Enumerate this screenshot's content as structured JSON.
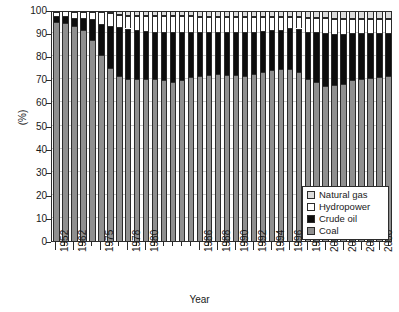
{
  "chart_data": {
    "type": "bar",
    "title": "",
    "subtitle": "",
    "xlabel": "Year",
    "ylabel": "(%)",
    "ylim": [
      0,
      100
    ],
    "ytick_labels": [
      "0",
      "10",
      "20",
      "30",
      "40",
      "50",
      "60",
      "70",
      "80",
      "90",
      "100"
    ],
    "ytick_values": [
      0,
      10,
      20,
      30,
      40,
      50,
      60,
      70,
      80,
      90,
      100
    ],
    "grid": true,
    "stacked": true,
    "legend_position": "inside-bottom-right",
    "legend_entries": [
      "Natural gas",
      "Hydropower",
      "Crude oil",
      "Coal"
    ],
    "categories": [
      "1952",
      "1957",
      "1962",
      "1965",
      "1970",
      "1975",
      "1976",
      "1977",
      "1978",
      "1979",
      "1980",
      "1981",
      "1982",
      "1983",
      "1984",
      "1985",
      "1986",
      "1987",
      "1988",
      "1989",
      "1990",
      "1991",
      "1992",
      "1993",
      "1994",
      "1995",
      "1996",
      "1997",
      "1998",
      "1999",
      "2000",
      "2001",
      "2002",
      "2003",
      "2004",
      "2005",
      "2006",
      "2007"
    ],
    "xtick_labels": [
      "1952",
      "1962",
      "1975",
      "1978",
      "1980",
      "1986",
      "1988",
      "1990",
      "1992",
      "1994",
      "1996",
      "1998",
      "2000",
      "2002",
      "2004",
      "2006"
    ],
    "series": [
      {
        "name": "Coal",
        "color": "#8f8f8f",
        "values": [
          95.0,
          94.5,
          93.0,
          91.5,
          87.0,
          80.5,
          75.0,
          71.5,
          70.0,
          70.0,
          70.0,
          70.0,
          69.5,
          69.0,
          69.5,
          71.0,
          71.5,
          72.0,
          72.5,
          72.0,
          72.0,
          71.5,
          72.5,
          73.0,
          74.0,
          74.5,
          74.5,
          73.0,
          70.0,
          69.0,
          67.0,
          67.5,
          68.0,
          69.5,
          70.0,
          70.5,
          71.0,
          71.5
        ]
      },
      {
        "name": "Crude oil",
        "color": "#0d0d0d",
        "values": [
          2.5,
          3.0,
          3.5,
          5.0,
          9.0,
          13.5,
          18.0,
          21.0,
          22.0,
          21.5,
          21.0,
          20.5,
          21.0,
          21.5,
          21.0,
          19.5,
          19.0,
          18.5,
          18.0,
          18.5,
          18.5,
          19.0,
          18.0,
          18.0,
          17.5,
          17.0,
          17.5,
          19.0,
          20.5,
          21.5,
          23.0,
          22.0,
          21.5,
          20.5,
          20.0,
          19.5,
          19.0,
          18.5
        ]
      },
      {
        "name": "Hydropower",
        "color": "#ffffff",
        "values": [
          1.8,
          2.0,
          2.5,
          2.5,
          3.0,
          5.0,
          5.5,
          5.5,
          5.5,
          6.0,
          6.5,
          7.0,
          7.0,
          7.0,
          7.0,
          7.0,
          6.5,
          6.5,
          6.5,
          6.5,
          6.5,
          6.5,
          6.5,
          6.0,
          5.5,
          5.5,
          5.0,
          5.0,
          6.0,
          6.0,
          6.5,
          6.5,
          6.5,
          6.0,
          6.0,
          6.0,
          6.0,
          6.0
        ]
      },
      {
        "name": "Natural gas",
        "color": "#dcdcdc",
        "values": [
          0.7,
          0.5,
          1.0,
          1.0,
          1.0,
          1.0,
          1.5,
          2.0,
          2.5,
          2.5,
          2.5,
          2.5,
          2.5,
          2.5,
          2.5,
          2.5,
          3.0,
          3.0,
          3.0,
          3.0,
          3.0,
          3.0,
          3.0,
          3.0,
          3.0,
          3.0,
          3.0,
          3.0,
          3.5,
          3.5,
          3.5,
          4.0,
          4.0,
          4.0,
          4.0,
          4.0,
          4.0,
          4.0
        ]
      }
    ]
  },
  "legend": {
    "items": [
      {
        "label": "Natural gas",
        "swatch": "sw-gas",
        "icon": "square-swatch-icon"
      },
      {
        "label": "Hydropower",
        "swatch": "sw-hydro",
        "icon": "square-swatch-icon"
      },
      {
        "label": "Crude oil",
        "swatch": "sw-oil",
        "icon": "square-swatch-icon"
      },
      {
        "label": "Coal",
        "swatch": "sw-coal",
        "icon": "square-swatch-icon"
      }
    ]
  },
  "axes": {
    "y_title": "(%)",
    "x_title": "Year"
  }
}
